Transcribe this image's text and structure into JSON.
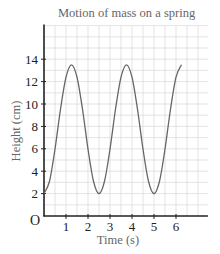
{
  "chart_data": {
    "type": "line",
    "title": "Motion of mass on a spring",
    "xlabel": "Time (s)",
    "ylabel": "Height (cm)",
    "origin_label": "O",
    "xlim": [
      0,
      7.45
    ],
    "ylim": [
      0,
      17
    ],
    "x_ticks": [
      1,
      2,
      3,
      4,
      5,
      6
    ],
    "y_ticks": [
      2,
      4,
      6,
      8,
      10,
      12,
      14
    ],
    "grid": true,
    "grid_minor_x": 0.5,
    "grid_minor_y": 1,
    "series": [
      {
        "name": "Height",
        "x": [
          0,
          0.25,
          0.5,
          0.75,
          1.0,
          1.25,
          1.5,
          1.75,
          2.0,
          2.25,
          2.5,
          2.75,
          3.0,
          3.25,
          3.5,
          3.75,
          4.0,
          4.25,
          4.5,
          4.75,
          5.0,
          5.25,
          5.5,
          5.75,
          6.0,
          6.25
        ],
        "values": [
          2.0,
          3.1,
          5.97,
          9.53,
          12.4,
          13.5,
          12.4,
          9.53,
          5.97,
          3.1,
          2.0,
          3.1,
          5.97,
          9.53,
          12.4,
          13.5,
          12.4,
          9.53,
          5.97,
          3.1,
          2.0,
          3.1,
          5.97,
          9.53,
          12.4,
          13.5
        ]
      }
    ]
  },
  "colors": {
    "grid": "#dcdcdc",
    "axis": "#222222",
    "curve": "#666666",
    "tick_label": "#222222"
  }
}
